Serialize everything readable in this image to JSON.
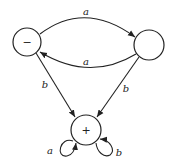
{
  "diagram": {
    "type": "finite-automaton",
    "states": [
      {
        "id": "s1",
        "label": "−",
        "initial": true
      },
      {
        "id": "s2",
        "label": ""
      },
      {
        "id": "s3",
        "label": "+",
        "final": true
      }
    ],
    "transitions": [
      {
        "from": "s1",
        "to": "s2",
        "label": "a"
      },
      {
        "from": "s2",
        "to": "s1",
        "label": "a"
      },
      {
        "from": "s1",
        "to": "s3",
        "label": "b"
      },
      {
        "from": "s2",
        "to": "s3",
        "label": "b"
      },
      {
        "from": "s3",
        "to": "s3",
        "label": "a"
      },
      {
        "from": "s3",
        "to": "s3",
        "label": "b"
      }
    ]
  }
}
